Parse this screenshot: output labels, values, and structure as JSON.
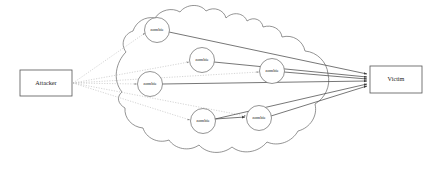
{
  "diagram": {
    "background_color": "#ffffff",
    "colors": {
      "node_stroke": "#555555",
      "circle_stroke": "#666666",
      "cloud_stroke": "#666666",
      "control_edge": "#b9b9b9",
      "attack_edge": "#4a4a4a",
      "text": "#1a1a1a"
    },
    "attacker": {
      "label": "Attacker",
      "x": 20,
      "y": 70,
      "width": 52,
      "height": 26
    },
    "victim": {
      "label": "Victim",
      "x": 370,
      "y": 66,
      "width": 52,
      "height": 27
    },
    "zombies": [
      {
        "id": "zombie-1",
        "label": "zombie",
        "cx": 157,
        "cy": 30,
        "r": 12.5
      },
      {
        "id": "zombie-2",
        "label": "zombie",
        "cx": 202,
        "cy": 60,
        "r": 12.5
      },
      {
        "id": "zombie-3",
        "label": "zombie",
        "cx": 272,
        "cy": 71,
        "r": 12.5
      },
      {
        "id": "zombie-4",
        "label": "zombie",
        "cx": 150,
        "cy": 84,
        "r": 12.5
      },
      {
        "id": "zombie-5",
        "label": "zombie",
        "cx": 203,
        "cy": 121,
        "r": 12.5
      },
      {
        "id": "zombie-6",
        "label": "zombie",
        "cx": 259,
        "cy": 118,
        "r": 12.5
      }
    ],
    "control_edges": [
      {
        "from": "attacker",
        "to": "zombie-1"
      },
      {
        "from": "attacker",
        "to": "zombie-2"
      },
      {
        "from": "attacker",
        "to": "zombie-3"
      },
      {
        "from": "attacker",
        "to": "zombie-4"
      },
      {
        "from": "attacker",
        "to": "zombie-5"
      },
      {
        "from": "attacker",
        "to": "zombie-6"
      }
    ],
    "attack_edges": [
      {
        "from": "zombie-1",
        "to": "victim"
      },
      {
        "from": "zombie-2",
        "to": "victim"
      },
      {
        "from": "zombie-3",
        "to": "victim"
      },
      {
        "from": "zombie-4",
        "to": "victim"
      },
      {
        "from": "zombie-5",
        "to": "victim"
      },
      {
        "from": "zombie-6",
        "to": "victim"
      }
    ],
    "cloud": {
      "name": "botnet-cloud",
      "path": "M 122 92 C 112 80 116 62 126 52 C 120 44 124 34 133 31 C 136 22 145 16 155 18 C 160 10 172 7 180 12 C 186 4 200 3 206 11 C 214 6 224 10 226 18 C 233 11 244 13 247 21 C 254 16 262 20 263 27 C 272 24 281 29 282 37 C 293 34 303 41 305 51 C 317 52 327 62 328 74 C 331 86 325 98 315 104 C 318 116 310 128 298 131 C 292 142 278 147 267 142 C 258 153 242 155 232 147 C 222 155 207 154 199 145 C 189 152 175 149 169 140 C 158 144 146 138 143 128 C 132 127 124 118 125 108 C 118 104 116 97 122 92 Z"
    }
  }
}
